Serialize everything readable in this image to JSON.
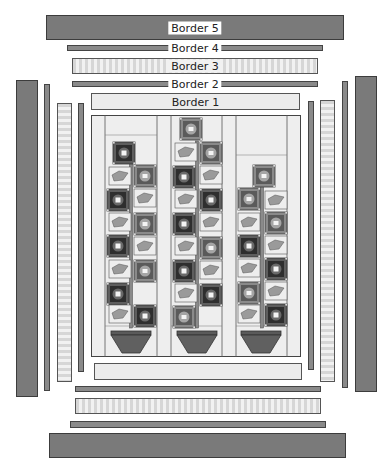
{
  "diagram": {
    "colors": {
      "dark_border": "#7a7a7a",
      "light_border": "#ececec",
      "outline": "#3c3c3c",
      "block_dark": "#3a3a3a",
      "block_mid": "#7d7d7d",
      "leaf": "#9a9a9a",
      "pot": "#606060",
      "background_fabric": "#eeeeee"
    },
    "borders": [
      {
        "id": 1,
        "label": "Border 1",
        "fabric": "light solid"
      },
      {
        "id": 2,
        "label": "Border 2",
        "fabric": "medium gray narrow"
      },
      {
        "id": 3,
        "label": "Border 3",
        "fabric": "light stripe"
      },
      {
        "id": 4,
        "label": "Border 4",
        "fabric": "medium gray narrow"
      },
      {
        "id": 5,
        "label": "Border 5",
        "fabric": "dark gray wide"
      }
    ],
    "center_panel": {
      "columns": 3,
      "description": "Three flower stems with square flower blocks, leaves and trapezoid pots",
      "column_flowers": [
        {
          "column": 1,
          "flower_count": 7
        },
        {
          "column": 2,
          "flower_count": 9
        },
        {
          "column": 3,
          "flower_count": 7
        }
      ]
    }
  }
}
